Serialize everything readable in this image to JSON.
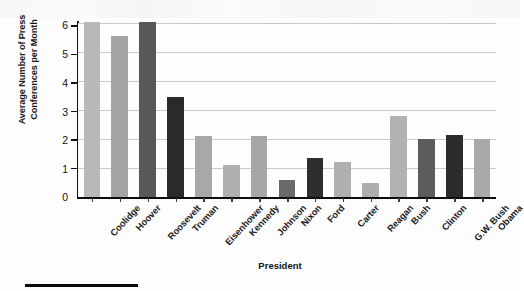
{
  "chart_data": {
    "type": "bar",
    "title": "",
    "xlabel": "President",
    "ylabel": "Average Number of Press\nConferences per Month",
    "categories": [
      "Coolidge",
      "Hoover",
      "Roosevelt",
      "Truman",
      "Eisenhower",
      "Kennedy",
      "Johnson",
      "Nixon",
      "Ford",
      "Carter",
      "Reagan",
      "Bush",
      "Clinton",
      "G.W. Bush",
      "Obama"
    ],
    "values": [
      6.05,
      5.55,
      6.05,
      3.45,
      2.1,
      1.1,
      2.1,
      0.6,
      1.35,
      1.2,
      0.5,
      2.8,
      2.0,
      2.15,
      2.0
    ],
    "bar_colors": [
      "#b9b9b9",
      "#a3a3a3",
      "#585858",
      "#2a2a2a",
      "#a8a8a8",
      "#b0b0b0",
      "#a6a6a6",
      "#6a6a6a",
      "#2e2e2e",
      "#b0b0b0",
      "#aeaeae",
      "#b2b2b2",
      "#5c5c5c",
      "#2b2b2b",
      "#a9a9a9"
    ],
    "ylim": [
      0,
      6
    ],
    "yticks": [
      0,
      1,
      2,
      3,
      4,
      5,
      6
    ],
    "ytick_labels": [
      "0",
      "1",
      "2",
      "3",
      "4",
      "5",
      "6"
    ],
    "grid": true,
    "grid_axis": "y",
    "legend": false,
    "gridline_color": "#c9c9c9",
    "axis_color": "#111111"
  }
}
